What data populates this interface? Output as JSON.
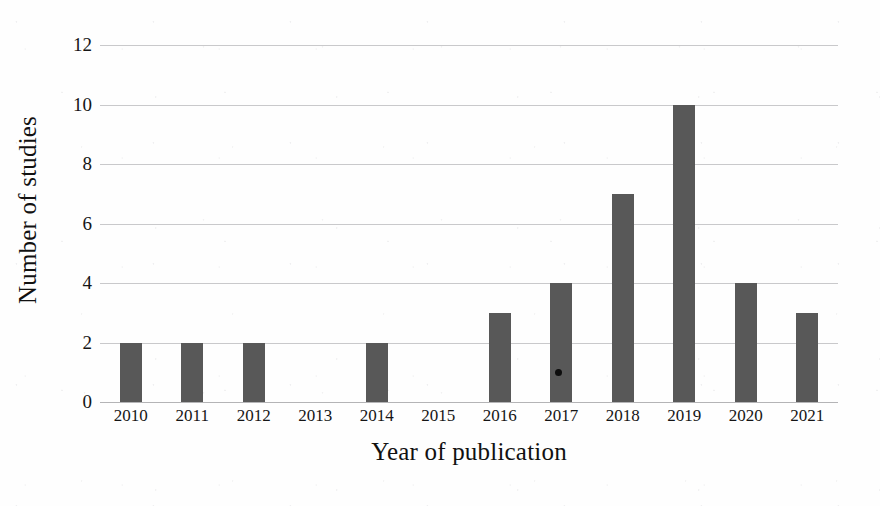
{
  "chart_data": {
    "type": "bar",
    "title": "",
    "xlabel": "Year of publication",
    "ylabel": "Number of studies",
    "categories": [
      "2010",
      "2011",
      "2012",
      "2013",
      "2014",
      "2015",
      "2016",
      "2017",
      "2018",
      "2019",
      "2020",
      "2021"
    ],
    "values": [
      2,
      2,
      2,
      0,
      2,
      0,
      3,
      4,
      7,
      10,
      4,
      3
    ],
    "ylim": [
      0,
      12
    ],
    "ytick_labels": [
      "0",
      "2",
      "4",
      "6",
      "8",
      "10",
      "12"
    ],
    "ytick_values": [
      0,
      2,
      4,
      6,
      8,
      10,
      12
    ],
    "grid": "horizontal",
    "legend": "none",
    "bar_color": "#585858",
    "gridline_color": "#c9c9cb",
    "background_color": "#fefefe",
    "annotations": [
      {
        "name": "scan-speck",
        "category": "2017",
        "value": 1
      }
    ]
  }
}
